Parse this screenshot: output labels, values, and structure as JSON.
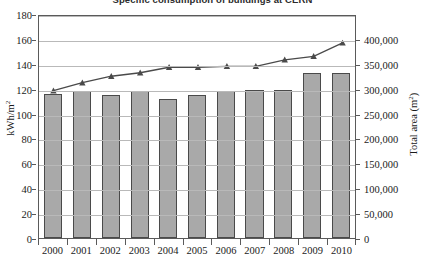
{
  "chart_data": {
    "type": "bar",
    "title": "Specific consumption of buildings at CERN",
    "categories": [
      "2000",
      "2001",
      "2002",
      "2003",
      "2004",
      "2005",
      "2006",
      "2007",
      "2008",
      "2009",
      "2010"
    ],
    "xlabel": "",
    "grid": true,
    "legend_position": "none",
    "series": [
      {
        "name": "Specific consumption",
        "type": "bar",
        "axis": "left",
        "unit": "kWh/m2",
        "values": [
          116,
          118,
          115,
          118,
          112,
          115,
          118,
          119,
          119,
          133,
          133
        ]
      },
      {
        "name": "Total area",
        "type": "line",
        "axis": "right",
        "unit": "m2",
        "marker": "triangle",
        "values": [
          300000,
          316000,
          329000,
          336000,
          347000,
          347000,
          349000,
          349000,
          362000,
          369000,
          396000
        ]
      }
    ],
    "left_axis": {
      "label": "kWh/m",
      "label_sup": "2",
      "min": 0,
      "max": 180,
      "step": 20,
      "ticks": [
        "0",
        "20",
        "40",
        "60",
        "80",
        "100",
        "120",
        "140",
        "160",
        "180"
      ]
    },
    "right_axis": {
      "label": "Total area (m",
      "label_sup": "2",
      "label_tail": ")",
      "min": 0,
      "max": 450000,
      "step": 50000,
      "ticks": [
        "0",
        "50,000",
        "100,000",
        "150,000",
        "200,000",
        "250,000",
        "300,000",
        "350,000",
        "400,000"
      ]
    },
    "colors": {
      "bar_fill": "#a9a9a9",
      "bar_border": "#4a4a4a",
      "line": "#4a4a4a",
      "grid": "#b9b9b9",
      "frame": "#5a5a5a"
    }
  }
}
